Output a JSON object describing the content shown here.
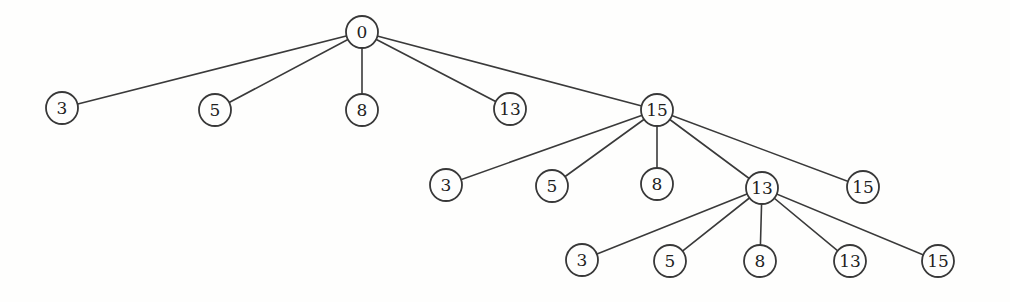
{
  "figure": {
    "background": "#fefefd",
    "stroke_color": "#3a3a3a",
    "node_fill": "#fefefd",
    "text_color": "#1f1f1f",
    "node_radius": 16,
    "nodes": [
      {
        "id": "root",
        "label": "0",
        "x": 362,
        "y": 32
      },
      {
        "id": "a1",
        "label": "3",
        "x": 62,
        "y": 108
      },
      {
        "id": "a2",
        "label": "5",
        "x": 215,
        "y": 110
      },
      {
        "id": "a3",
        "label": "8",
        "x": 362,
        "y": 110
      },
      {
        "id": "a4",
        "label": "13",
        "x": 510,
        "y": 109
      },
      {
        "id": "a5",
        "label": "15",
        "x": 657,
        "y": 110
      },
      {
        "id": "b1",
        "label": "3",
        "x": 446,
        "y": 185
      },
      {
        "id": "b2",
        "label": "5",
        "x": 552,
        "y": 186
      },
      {
        "id": "b3",
        "label": "8",
        "x": 657,
        "y": 184
      },
      {
        "id": "b4",
        "label": "13",
        "x": 762,
        "y": 188
      },
      {
        "id": "b5",
        "label": "15",
        "x": 863,
        "y": 187
      },
      {
        "id": "c1",
        "label": "3",
        "x": 582,
        "y": 260
      },
      {
        "id": "c2",
        "label": "5",
        "x": 670,
        "y": 261
      },
      {
        "id": "c3",
        "label": "8",
        "x": 760,
        "y": 261
      },
      {
        "id": "c4",
        "label": "13",
        "x": 850,
        "y": 261
      },
      {
        "id": "c5",
        "label": "15",
        "x": 938,
        "y": 261
      }
    ],
    "edges": [
      [
        "root",
        "a1"
      ],
      [
        "root",
        "a2"
      ],
      [
        "root",
        "a3"
      ],
      [
        "root",
        "a4"
      ],
      [
        "root",
        "a5"
      ],
      [
        "a5",
        "b1"
      ],
      [
        "a5",
        "b2"
      ],
      [
        "a5",
        "b3"
      ],
      [
        "a5",
        "b4"
      ],
      [
        "a5",
        "b5"
      ],
      [
        "b4",
        "c1"
      ],
      [
        "b4",
        "c2"
      ],
      [
        "b4",
        "c3"
      ],
      [
        "b4",
        "c4"
      ],
      [
        "b4",
        "c5"
      ]
    ]
  }
}
